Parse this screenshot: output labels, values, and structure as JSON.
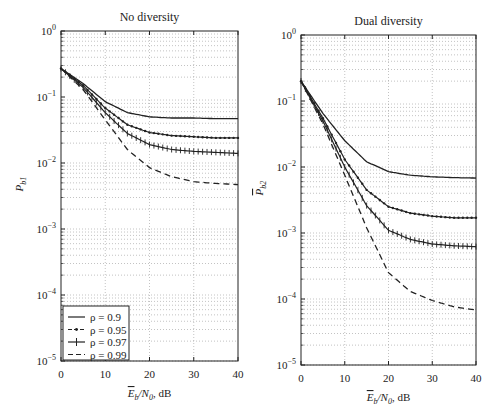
{
  "chart_data": [
    {
      "type": "line",
      "title": "No diversity",
      "xlabel": "Ē_b/N_0, dB",
      "ylabel": "P_b1",
      "xlim": [
        0,
        40
      ],
      "ylim": [
        1e-05,
        1
      ],
      "yscale": "log",
      "grid": true,
      "x_ticks": [
        0,
        10,
        20,
        30,
        40
      ],
      "y_ticks": [
        "10^0",
        "10^-1",
        "10^-2",
        "10^-3",
        "10^-4",
        "10^-5"
      ],
      "legend_position": "lower left",
      "x": [
        0,
        5,
        10,
        15,
        20,
        25,
        30,
        35,
        40
      ],
      "series": [
        {
          "name": "ρ = 0.9",
          "style": "solid",
          "values": [
            0.27,
            0.16,
            0.085,
            0.058,
            0.05,
            0.048,
            0.048,
            0.047,
            0.047
          ]
        },
        {
          "name": "ρ = 0.95",
          "style": "dash-dot",
          "values": [
            0.27,
            0.15,
            0.068,
            0.038,
            0.029,
            0.026,
            0.025,
            0.024,
            0.024
          ]
        },
        {
          "name": "ρ = 0.97",
          "style": "solid-plus",
          "values": [
            0.27,
            0.14,
            0.058,
            0.028,
            0.019,
            0.016,
            0.015,
            0.0145,
            0.014
          ]
        },
        {
          "name": "ρ = 0.99",
          "style": "dashed",
          "values": [
            0.27,
            0.13,
            0.045,
            0.016,
            0.0085,
            0.0062,
            0.0052,
            0.0049,
            0.0047
          ]
        }
      ]
    },
    {
      "type": "line",
      "title": "Dual diversity",
      "xlabel": "Ē_b/N_0, dB",
      "ylabel": "P̄_b2",
      "xlim": [
        0,
        40
      ],
      "ylim": [
        1e-05,
        1
      ],
      "yscale": "log",
      "grid": true,
      "x_ticks": [
        0,
        10,
        20,
        30,
        40
      ],
      "y_ticks": [
        "10^0",
        "10^-1",
        "10^-2",
        "10^-3",
        "10^-4",
        "10^-5"
      ],
      "x": [
        0,
        5,
        10,
        15,
        20,
        25,
        30,
        35,
        40
      ],
      "series": [
        {
          "name": "ρ = 0.9",
          "style": "solid",
          "values": [
            0.2,
            0.065,
            0.025,
            0.012,
            0.0085,
            0.0075,
            0.0071,
            0.0069,
            0.0068
          ]
        },
        {
          "name": "ρ = 0.95",
          "style": "dash-dot",
          "values": [
            0.2,
            0.055,
            0.013,
            0.0045,
            0.0025,
            0.002,
            0.0018,
            0.0017,
            0.0017
          ]
        },
        {
          "name": "ρ = 0.97",
          "style": "solid-plus",
          "values": [
            0.2,
            0.05,
            0.01,
            0.0026,
            0.0011,
            0.0008,
            0.00068,
            0.00064,
            0.00062
          ]
        },
        {
          "name": "ρ = 0.99",
          "style": "dashed",
          "values": [
            0.2,
            0.045,
            0.0075,
            0.0012,
            0.00025,
            0.00013,
            9.5e-05,
            7.6e-05,
            6.8e-05
          ]
        }
      ]
    }
  ],
  "labels": {
    "left_title": "No diversity",
    "right_title": "Dual diversity",
    "xtick": [
      "0",
      "10",
      "20",
      "30",
      "40"
    ],
    "legend": [
      "ρ = 0.9",
      "ρ = 0.95",
      "ρ = 0.97",
      "ρ = 0.99"
    ]
  },
  "colors": {
    "line": "#222222",
    "grid": "#9a9a9a",
    "axis": "#222222"
  }
}
